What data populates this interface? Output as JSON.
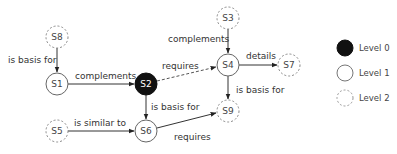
{
  "diagram": {
    "nodes": [
      {
        "id": "S8",
        "label": "S8",
        "level": 2
      },
      {
        "id": "S1",
        "label": "S1",
        "level": 1
      },
      {
        "id": "S2",
        "label": "S2",
        "level": 0
      },
      {
        "id": "S5",
        "label": "S5",
        "level": 2
      },
      {
        "id": "S6",
        "label": "S6",
        "level": 1
      },
      {
        "id": "S3",
        "label": "S3",
        "level": 2
      },
      {
        "id": "S4",
        "label": "S4",
        "level": 1
      },
      {
        "id": "S7",
        "label": "S7",
        "level": 2
      },
      {
        "id": "S9",
        "label": "S9",
        "level": 2
      }
    ],
    "edges": [
      {
        "from": "S8",
        "to": "S1",
        "label": "is basis for"
      },
      {
        "from": "S1",
        "to": "S2",
        "label": "complements"
      },
      {
        "from": "S2",
        "to": "S4",
        "label": "requires",
        "style": "dashed"
      },
      {
        "from": "S2",
        "to": "S6",
        "label": "is basis for"
      },
      {
        "from": "S5",
        "to": "S6",
        "label": "is similar to"
      },
      {
        "from": "S6",
        "to": "S9",
        "label": "requires"
      },
      {
        "from": "S3",
        "to": "S4",
        "label": "complements"
      },
      {
        "from": "S4",
        "to": "S7",
        "label": "details"
      },
      {
        "from": "S4",
        "to": "S9",
        "label": "is basis for"
      }
    ]
  },
  "legend": {
    "items": [
      {
        "label": "Level 0",
        "style": "filled"
      },
      {
        "label": "Level 1",
        "style": "solid"
      },
      {
        "label": "Level 2",
        "style": "dashed"
      }
    ]
  }
}
